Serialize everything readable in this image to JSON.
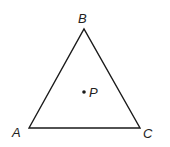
{
  "diagram": {
    "type": "triangle",
    "stroke_color": "#1a1a1a",
    "vertices": [
      {
        "name": "A",
        "label": "A",
        "x": 29,
        "y": 128,
        "label_x": 12,
        "label_y": 137
      },
      {
        "name": "B",
        "label": "B",
        "x": 84,
        "y": 29,
        "label_x": 78,
        "label_y": 23
      },
      {
        "name": "C",
        "label": "C",
        "x": 140,
        "y": 128,
        "label_x": 143,
        "label_y": 138
      }
    ],
    "point": {
      "name": "P",
      "label": "P",
      "x": 84,
      "y": 92,
      "label_x": 89,
      "label_y": 97
    }
  }
}
